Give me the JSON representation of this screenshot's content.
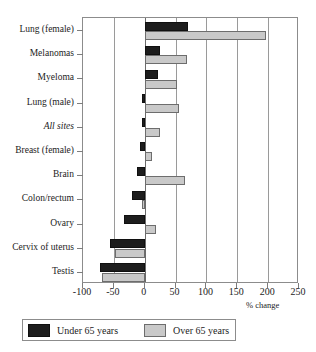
{
  "chart_data": {
    "type": "bar",
    "orientation": "horizontal",
    "title": "",
    "xlabel": "% change",
    "ylabel": "",
    "xlim": [
      -100,
      250
    ],
    "xticks": [
      -100,
      -50,
      0,
      50,
      100,
      150,
      200,
      250
    ],
    "xtick_labels": [
      "-100",
      "-50",
      "0",
      "50",
      "100",
      "150",
      "200",
      "250"
    ],
    "grid": true,
    "grid_axis": "x",
    "legend_position": "bottom",
    "categories": [
      "Lung (female)",
      "Melanomas",
      "Myeloma",
      "Lung (male)",
      "All sites",
      "Breast (female)",
      "Brain",
      "Colon/rectum",
      "Ovary",
      "Cervix of uterus",
      "Testis"
    ],
    "category_styles": [
      "normal",
      "normal",
      "normal",
      "normal",
      "italic",
      "normal",
      "normal",
      "normal",
      "normal",
      "normal",
      "normal"
    ],
    "series": [
      {
        "name": "Under 65 years",
        "color": "#1d1d1d",
        "values": [
          70,
          25,
          22,
          -5,
          -5,
          -8,
          -13,
          -20,
          -33,
          -57,
          -73
        ]
      },
      {
        "name": "Over 65 years",
        "color": "#c9c9c9",
        "values": [
          196,
          68,
          52,
          55,
          25,
          12,
          66,
          -5,
          18,
          -48,
          -70
        ]
      }
    ]
  },
  "legend": {
    "entries": [
      {
        "label": "Under 65 years",
        "swatch": "under-65-swatch"
      },
      {
        "label": "Over 65 years",
        "swatch": "over-65-swatch"
      }
    ]
  }
}
